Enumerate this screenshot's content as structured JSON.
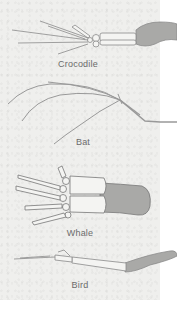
{
  "figure": {
    "panels": [
      {
        "id": "crocodile",
        "label": "Crocodile"
      },
      {
        "id": "bat",
        "label": "Bat"
      },
      {
        "id": "whale",
        "label": "Whale"
      },
      {
        "id": "bird",
        "label": "Bird"
      }
    ]
  },
  "colors": {
    "paper": "#efefed",
    "bone": "#f4f4f2",
    "bone_outline": "#8a8a8a",
    "flesh": "#a9a9a7",
    "label": "#6b6b6b"
  }
}
